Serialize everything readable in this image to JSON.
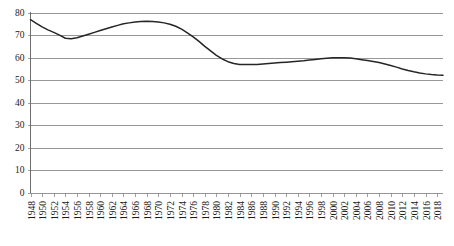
{
  "chart_data": {
    "type": "line",
    "title": "",
    "subtitle": "",
    "xlabel": "",
    "ylabel": "",
    "ylim": [
      0,
      80
    ],
    "xlim": [
      1948,
      2019
    ],
    "grid": true,
    "legend": false,
    "y_ticks": [
      0,
      10,
      20,
      30,
      40,
      50,
      60,
      70,
      80
    ],
    "y_tick_labels": [
      "0",
      "10",
      "20",
      "30",
      "40",
      "50",
      "60",
      "70",
      "80"
    ],
    "x_tick_labels": [
      "1948",
      "1950",
      "1952",
      "1954",
      "1956",
      "1958",
      "1960",
      "1962",
      "1964",
      "1966",
      "1968",
      "1970",
      "1972",
      "1974",
      "1976",
      "1978",
      "1980",
      "1982",
      "1984",
      "1986",
      "1988",
      "1990",
      "1992",
      "1994",
      "1996",
      "1998",
      "2000",
      "2002",
      "2004",
      "2006",
      "2008",
      "2010",
      "2012",
      "2014",
      "2016",
      "2018"
    ],
    "x_tick_rotation": -90,
    "series": [
      {
        "name": "value",
        "color": "#262626",
        "x": [
          1948,
          1949,
          1950,
          1951,
          1952,
          1953,
          1954,
          1955,
          1956,
          1957,
          1958,
          1959,
          1960,
          1961,
          1962,
          1963,
          1964,
          1965,
          1966,
          1967,
          1968,
          1969,
          1970,
          1971,
          1972,
          1973,
          1974,
          1975,
          1976,
          1977,
          1978,
          1979,
          1980,
          1981,
          1982,
          1983,
          1984,
          1985,
          1986,
          1987,
          1988,
          1989,
          1990,
          1991,
          1992,
          1993,
          1994,
          1995,
          1996,
          1997,
          1998,
          1999,
          2000,
          2001,
          2002,
          2003,
          2004,
          2005,
          2006,
          2007,
          2008,
          2009,
          2010,
          2011,
          2012,
          2013,
          2014,
          2015,
          2016,
          2017,
          2018,
          2019
        ],
        "values": [
          76.8,
          75.2,
          73.6,
          72.3,
          71.2,
          70.0,
          68.6,
          68.4,
          68.8,
          69.6,
          70.4,
          71.2,
          72.0,
          72.8,
          73.6,
          74.3,
          75.0,
          75.4,
          75.8,
          76.0,
          76.1,
          76.0,
          75.8,
          75.4,
          74.8,
          73.9,
          72.6,
          71.0,
          69.2,
          67.2,
          65.0,
          63.0,
          61.0,
          59.4,
          58.2,
          57.4,
          57.0,
          56.9,
          56.9,
          57.0,
          57.2,
          57.4,
          57.6,
          57.8,
          58.0,
          58.2,
          58.4,
          58.6,
          58.9,
          59.2,
          59.5,
          59.7,
          59.9,
          60.0,
          59.9,
          59.8,
          59.5,
          59.1,
          58.7,
          58.3,
          57.8,
          57.2,
          56.5,
          55.8,
          55.0,
          54.3,
          53.7,
          53.2,
          52.8,
          52.5,
          52.3,
          52.2
        ]
      }
    ]
  }
}
